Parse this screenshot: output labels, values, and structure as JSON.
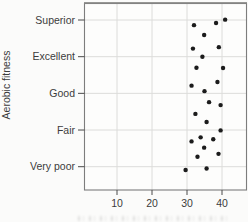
{
  "figure": {
    "y_axis_title": "Aerobic fitness",
    "x_axis_label_clipped": true
  },
  "chart_data": {
    "type": "scatter",
    "title": "",
    "xlabel": "",
    "ylabel": "Aerobic fitness",
    "x_ticks": [
      10,
      20,
      30,
      40
    ],
    "xlim": [
      0.7,
      47
    ],
    "categories": [
      "Very poor",
      "Fair",
      "Good",
      "Excellent",
      "Superior"
    ],
    "y_scale_note": "y is category index with jitter: 0 = Very poor, 4 = Superior",
    "grid": true,
    "legend_position": "none",
    "points": [
      {
        "x": 32.0,
        "y": 3.86,
        "category": "Superior"
      },
      {
        "x": 38.3,
        "y": 3.92,
        "category": "Superior"
      },
      {
        "x": 40.9,
        "y": 4.01,
        "category": "Superior"
      },
      {
        "x": 34.9,
        "y": 3.59,
        "category": "Superior"
      },
      {
        "x": 31.7,
        "y": 3.22,
        "category": "Excellent"
      },
      {
        "x": 39.1,
        "y": 3.26,
        "category": "Excellent"
      },
      {
        "x": 34.4,
        "y": 3.0,
        "category": "Excellent"
      },
      {
        "x": 32.7,
        "y": 2.7,
        "category": "Excellent"
      },
      {
        "x": 40.3,
        "y": 2.69,
        "category": "Excellent"
      },
      {
        "x": 31.3,
        "y": 2.21,
        "category": "Good"
      },
      {
        "x": 38.7,
        "y": 2.31,
        "category": "Good"
      },
      {
        "x": 35.0,
        "y": 2.06,
        "category": "Good"
      },
      {
        "x": 36.3,
        "y": 1.76,
        "category": "Good"
      },
      {
        "x": 39.6,
        "y": 1.68,
        "category": "Good"
      },
      {
        "x": 32.4,
        "y": 1.44,
        "category": "Fair"
      },
      {
        "x": 35.6,
        "y": 1.22,
        "category": "Fair"
      },
      {
        "x": 39.6,
        "y": 0.99,
        "category": "Fair"
      },
      {
        "x": 33.9,
        "y": 0.8,
        "category": "Fair"
      },
      {
        "x": 31.3,
        "y": 0.69,
        "category": "Fair"
      },
      {
        "x": 37.5,
        "y": 0.75,
        "category": "Fair"
      },
      {
        "x": 34.9,
        "y": 0.52,
        "category": "Fair"
      },
      {
        "x": 33.0,
        "y": 0.27,
        "category": "Very poor"
      },
      {
        "x": 39.0,
        "y": 0.35,
        "category": "Very poor"
      },
      {
        "x": 29.6,
        "y": -0.09,
        "category": "Very poor"
      },
      {
        "x": 35.6,
        "y": -0.05,
        "category": "Very poor"
      }
    ],
    "colors": {
      "dot": "#1c1c1c",
      "grid": "#dcdcda",
      "frame": "#7d7d7d",
      "frame_top": "#979795",
      "axis": "#4a4a4a",
      "text": "#3c3c3c",
      "plot_bg": "#fdfdfc",
      "page_bg": "#fbfbfa"
    }
  }
}
